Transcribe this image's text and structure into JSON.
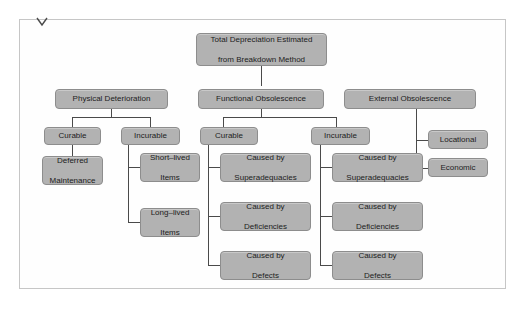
{
  "figure": {
    "chevron_icon": "chevron-down-icon",
    "scan_bleed_top": "",
    "scan_bleed_bottom": "",
    "colors": {
      "node_fill": "#b2b2b2",
      "node_border": "#8d8d8d",
      "connector": "#4a4a4a",
      "frame_border": "#c6c6c6",
      "panel_background": "#fefefe",
      "text": "#1d1d1d"
    }
  },
  "diagram": {
    "type": "tree",
    "root": {
      "id": "total-depreciation",
      "label": "Total Depreciation Estimated from Breakdown Method",
      "lines": [
        "Total Depreciation Estimated",
        "from Breakdown Method"
      ]
    },
    "nodes": [
      {
        "id": "physical-deterioration",
        "label": "Physical Deterioration",
        "lines": [
          "Physical Deterioration"
        ],
        "level": 2
      },
      {
        "id": "functional-obsolescence",
        "label": "Functional Obsolescence",
        "lines": [
          "Functional Obsolescence"
        ],
        "level": 2
      },
      {
        "id": "external-obsolescence",
        "label": "External Obsolescence",
        "lines": [
          "External Obsolescence"
        ],
        "level": 2
      },
      {
        "id": "physical-curable",
        "label": "Curable",
        "lines": [
          "Curable"
        ],
        "level": 3,
        "parent": "physical-deterioration"
      },
      {
        "id": "physical-incurable",
        "label": "Incurable",
        "lines": [
          "Incurable"
        ],
        "level": 3,
        "parent": "physical-deterioration"
      },
      {
        "id": "functional-curable",
        "label": "Curable",
        "lines": [
          "Curable"
        ],
        "level": 3,
        "parent": "functional-obsolescence"
      },
      {
        "id": "functional-incurable",
        "label": "Incurable",
        "lines": [
          "Incurable"
        ],
        "level": 3,
        "parent": "functional-obsolescence"
      },
      {
        "id": "external-locational",
        "label": "Locational",
        "lines": [
          "Locational"
        ],
        "level": 3,
        "parent": "external-obsolescence"
      },
      {
        "id": "external-economic",
        "label": "Economic",
        "lines": [
          "Economic"
        ],
        "level": 3,
        "parent": "external-obsolescence"
      },
      {
        "id": "deferred-maintenance",
        "label": "Deferred Maintenance",
        "lines": [
          "Deferred",
          "Maintenance"
        ],
        "level": 4,
        "parent": "physical-curable"
      },
      {
        "id": "short-lived-items",
        "label": "Short–lived Items",
        "lines": [
          "Short–lived",
          "Items"
        ],
        "level": 4,
        "parent": "physical-incurable"
      },
      {
        "id": "long-lived-items",
        "label": "Long–lived Items",
        "lines": [
          "Long–lived",
          "Items"
        ],
        "level": 4,
        "parent": "physical-incurable"
      },
      {
        "id": "fc-superadequacies",
        "label": "Caused by Superadequacies",
        "lines": [
          "Caused by",
          "Superadequacies"
        ],
        "level": 4,
        "parent": "functional-curable"
      },
      {
        "id": "fc-deficiencies",
        "label": "Caused by Deficiencies",
        "lines": [
          "Caused by",
          "Deficiencies"
        ],
        "level": 4,
        "parent": "functional-curable"
      },
      {
        "id": "fc-defects",
        "label": "Caused by Defects",
        "lines": [
          "Caused by",
          "Defects"
        ],
        "level": 4,
        "parent": "functional-curable"
      },
      {
        "id": "fi-superadequacies",
        "label": "Caused by Superadequacies",
        "lines": [
          "Caused by",
          "Superadequacies"
        ],
        "level": 4,
        "parent": "functional-incurable"
      },
      {
        "id": "fi-deficiencies",
        "label": "Caused by Deficiencies",
        "lines": [
          "Caused by",
          "Deficiencies"
        ],
        "level": 4,
        "parent": "functional-incurable"
      },
      {
        "id": "fi-defects",
        "label": "Caused by Defects",
        "lines": [
          "Caused by",
          "Defects"
        ],
        "level": 4,
        "parent": "functional-incurable"
      }
    ]
  }
}
